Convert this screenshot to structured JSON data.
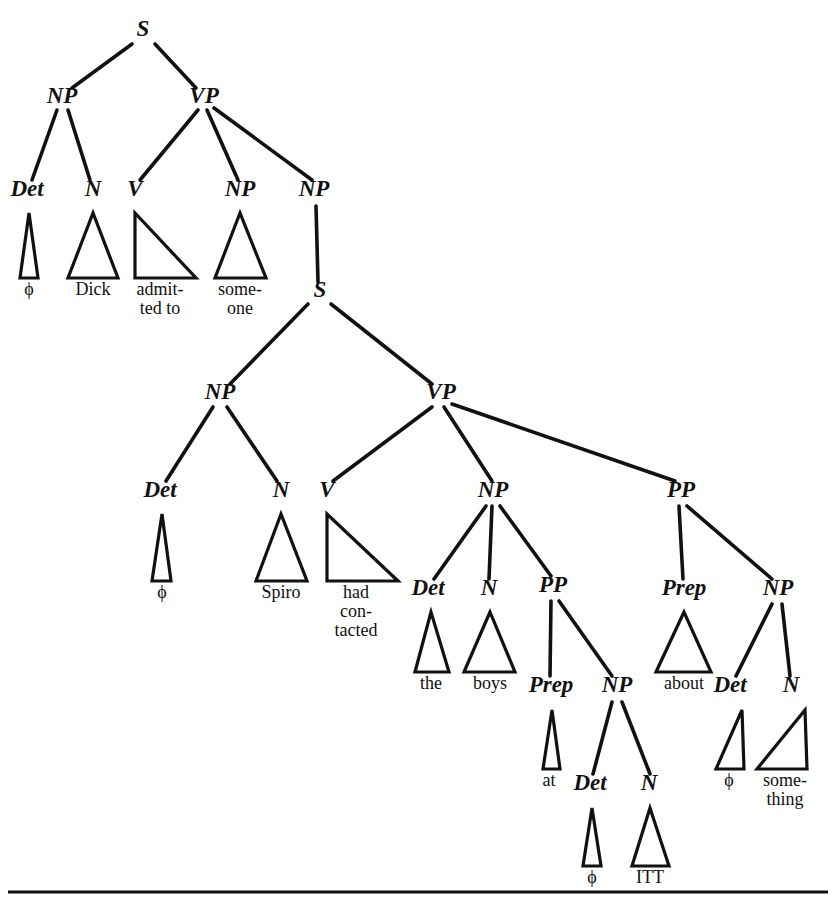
{
  "figure": {
    "type": "syntax-tree",
    "sentence": "ϕ Dick admitted to someone ϕ Spiro had contacted the boys at ϕ ITT about ϕ something",
    "ink_color": "#111111",
    "background_color": "#ffffff"
  },
  "nodes": [
    {
      "id": "S1",
      "label": "S",
      "x": 143,
      "y": 36,
      "size": 23
    },
    {
      "id": "NP1",
      "label": "NP",
      "x": 62,
      "y": 103,
      "size": 23
    },
    {
      "id": "VP1",
      "label": "VP",
      "x": 204,
      "y": 103,
      "size": 23
    },
    {
      "id": "Det1",
      "label": "Det",
      "x": 27,
      "y": 196,
      "size": 23
    },
    {
      "id": "N1",
      "label": "N",
      "x": 93,
      "y": 196,
      "size": 23
    },
    {
      "id": "V1",
      "label": "V",
      "x": 135,
      "y": 196,
      "size": 23
    },
    {
      "id": "NPso",
      "label": "NP",
      "x": 240,
      "y": 196,
      "size": 23
    },
    {
      "id": "NP2",
      "label": "NP",
      "x": 314,
      "y": 196,
      "size": 23
    },
    {
      "id": "S2",
      "label": "S",
      "x": 320,
      "y": 297,
      "size": 23
    },
    {
      "id": "NP3",
      "label": "NP",
      "x": 220,
      "y": 399,
      "size": 23
    },
    {
      "id": "VP2",
      "label": "VP",
      "x": 441,
      "y": 399,
      "size": 23
    },
    {
      "id": "Det2",
      "label": "Det",
      "x": 160,
      "y": 497,
      "size": 23
    },
    {
      "id": "N2",
      "label": "N",
      "x": 281,
      "y": 497,
      "size": 23
    },
    {
      "id": "V2",
      "label": "V",
      "x": 327,
      "y": 497,
      "size": 23
    },
    {
      "id": "NP4",
      "label": "NP",
      "x": 493,
      "y": 497,
      "size": 23
    },
    {
      "id": "PP1",
      "label": "PP",
      "x": 681,
      "y": 497,
      "size": 23
    },
    {
      "id": "Det3",
      "label": "Det",
      "x": 428,
      "y": 595,
      "size": 23
    },
    {
      "id": "N3",
      "label": "N",
      "x": 489,
      "y": 595,
      "size": 23
    },
    {
      "id": "PP2",
      "label": "PP",
      "x": 553,
      "y": 592,
      "size": 23
    },
    {
      "id": "Prep1",
      "label": "Prep",
      "x": 684,
      "y": 595,
      "size": 23
    },
    {
      "id": "NP5",
      "label": "NP",
      "x": 778,
      "y": 595,
      "size": 23
    },
    {
      "id": "Prep2",
      "label": "Prep",
      "x": 551,
      "y": 692,
      "size": 23
    },
    {
      "id": "NP6",
      "label": "NP",
      "x": 617,
      "y": 692,
      "size": 23
    },
    {
      "id": "Det5",
      "label": "Det",
      "x": 730,
      "y": 692,
      "size": 23
    },
    {
      "id": "N5",
      "label": "N",
      "x": 791,
      "y": 692,
      "size": 23
    },
    {
      "id": "Det4",
      "label": "Det",
      "x": 590,
      "y": 790,
      "size": 23
    },
    {
      "id": "N4",
      "label": "N",
      "x": 649,
      "y": 790,
      "size": 23
    }
  ],
  "edges": [
    {
      "from": "S1",
      "to": "NP1",
      "x1": 132,
      "y1": 44,
      "x2": 72,
      "y2": 88
    },
    {
      "from": "S1",
      "to": "VP1",
      "x1": 155,
      "y1": 44,
      "x2": 196,
      "y2": 88
    },
    {
      "from": "NP1",
      "to": "Det1",
      "x1": 57,
      "y1": 110,
      "x2": 32,
      "y2": 180
    },
    {
      "from": "NP1",
      "to": "N1",
      "x1": 68,
      "y1": 110,
      "x2": 90,
      "y2": 180
    },
    {
      "from": "VP1",
      "to": "V1",
      "x1": 198,
      "y1": 110,
      "x2": 140,
      "y2": 180
    },
    {
      "from": "VP1",
      "to": "NPso",
      "x1": 207,
      "y1": 110,
      "x2": 238,
      "y2": 180
    },
    {
      "from": "VP1",
      "to": "NP2",
      "x1": 214,
      "y1": 108,
      "x2": 312,
      "y2": 180
    },
    {
      "from": "NP2",
      "to": "S2",
      "x1": 316,
      "y1": 206,
      "x2": 318,
      "y2": 282
    },
    {
      "from": "S2",
      "to": "NP3",
      "x1": 308,
      "y1": 304,
      "x2": 230,
      "y2": 384
    },
    {
      "from": "S2",
      "to": "VP2",
      "x1": 331,
      "y1": 304,
      "x2": 432,
      "y2": 384
    },
    {
      "from": "NP3",
      "to": "Det2",
      "x1": 213,
      "y1": 407,
      "x2": 166,
      "y2": 481
    },
    {
      "from": "NP3",
      "to": "N3x",
      "x1": 227,
      "y1": 407,
      "x2": 277,
      "y2": 481
    },
    {
      "from": "VP2",
      "to": "V2",
      "x1": 432,
      "y1": 407,
      "x2": 333,
      "y2": 481
    },
    {
      "from": "VP2",
      "to": "NP4",
      "x1": 444,
      "y1": 407,
      "x2": 492,
      "y2": 481
    },
    {
      "from": "VP2",
      "to": "PP1",
      "x1": 452,
      "y1": 404,
      "x2": 675,
      "y2": 481
    },
    {
      "from": "NP4",
      "to": "Det3",
      "x1": 486,
      "y1": 506,
      "x2": 434,
      "y2": 579
    },
    {
      "from": "NP4",
      "to": "N3",
      "x1": 492,
      "y1": 506,
      "x2": 489,
      "y2": 579
    },
    {
      "from": "NP4",
      "to": "PP2",
      "x1": 500,
      "y1": 506,
      "x2": 551,
      "y2": 576
    },
    {
      "from": "PP1",
      "to": "Prep1",
      "x1": 679,
      "y1": 506,
      "x2": 683,
      "y2": 579
    },
    {
      "from": "PP1",
      "to": "NP5",
      "x1": 687,
      "y1": 506,
      "x2": 772,
      "y2": 579
    },
    {
      "from": "PP2",
      "to": "Prep2",
      "x1": 551,
      "y1": 601,
      "x2": 550,
      "y2": 676
    },
    {
      "from": "PP2",
      "to": "NP6",
      "x1": 559,
      "y1": 601,
      "x2": 612,
      "y2": 676
    },
    {
      "from": "NP6",
      "to": "Det4",
      "x1": 612,
      "y1": 702,
      "x2": 593,
      "y2": 774
    },
    {
      "from": "NP6",
      "to": "N4",
      "x1": 622,
      "y1": 702,
      "x2": 650,
      "y2": 774
    },
    {
      "from": "NP5",
      "to": "Det5",
      "x1": 772,
      "y1": 604,
      "x2": 736,
      "y2": 676
    },
    {
      "from": "NP5",
      "to": "N5",
      "x1": 782,
      "y1": 604,
      "x2": 790,
      "y2": 676
    }
  ],
  "triangles": [
    {
      "id": "tri-phi-1",
      "word": "ϕ",
      "shape": "narrow",
      "apex_x": 29,
      "apex_y": 213,
      "left_x": 20,
      "right_x": 38,
      "base_y": 278,
      "word_x": 29,
      "word_y": 295
    },
    {
      "id": "tri-dick",
      "word": "Dick",
      "shape": "isoceles",
      "apex_x": 93,
      "apex_y": 213,
      "left_x": 68,
      "right_x": 118,
      "base_y": 278,
      "word_x": 93,
      "word_y": 295
    },
    {
      "id": "tri-admitted-to",
      "word": "admit-\nted to",
      "shape": "right-left",
      "apex_x": 135,
      "apex_y": 213,
      "left_x": 135,
      "right_x": 196,
      "base_y": 278,
      "word_x": 160,
      "word_y": 295
    },
    {
      "id": "tri-someone",
      "word": "some-\none",
      "shape": "isoceles",
      "apex_x": 240,
      "apex_y": 213,
      "left_x": 215,
      "right_x": 266,
      "base_y": 278,
      "word_x": 240,
      "word_y": 295
    },
    {
      "id": "tri-phi-2",
      "word": "ϕ",
      "shape": "narrow",
      "apex_x": 162,
      "apex_y": 514,
      "left_x": 152,
      "right_x": 171,
      "base_y": 581,
      "word_x": 162,
      "word_y": 598
    },
    {
      "id": "tri-spiro",
      "word": "Spiro",
      "shape": "isoceles",
      "apex_x": 281,
      "apex_y": 514,
      "left_x": 256,
      "right_x": 307,
      "base_y": 581,
      "word_x": 281,
      "word_y": 598
    },
    {
      "id": "tri-had-contacted",
      "word": "had\ncon-\ntacted",
      "shape": "right-left",
      "apex_x": 327,
      "apex_y": 514,
      "left_x": 327,
      "right_x": 398,
      "base_y": 581,
      "word_x": 356,
      "word_y": 598
    },
    {
      "id": "tri-the",
      "word": "the",
      "shape": "narrow-iso",
      "apex_x": 431,
      "apex_y": 612,
      "left_x": 415,
      "right_x": 449,
      "base_y": 672,
      "word_x": 431,
      "word_y": 689
    },
    {
      "id": "tri-boys",
      "word": "boys",
      "shape": "isoceles",
      "apex_x": 490,
      "apex_y": 612,
      "left_x": 464,
      "right_x": 515,
      "base_y": 672,
      "word_x": 490,
      "word_y": 689
    },
    {
      "id": "tri-at",
      "word": "at",
      "shape": "narrow",
      "apex_x": 552,
      "apex_y": 710,
      "left_x": 543,
      "right_x": 560,
      "base_y": 769,
      "word_x": 549,
      "word_y": 786
    },
    {
      "id": "tri-about",
      "word": "about",
      "shape": "isoceles",
      "apex_x": 684,
      "apex_y": 612,
      "left_x": 656,
      "right_x": 711,
      "base_y": 672,
      "word_x": 684,
      "word_y": 689
    },
    {
      "id": "tri-phi-3",
      "word": "ϕ",
      "shape": "right-right",
      "apex_x": 742,
      "apex_y": 710,
      "left_x": 716,
      "right_x": 744,
      "base_y": 769,
      "word_x": 729,
      "word_y": 786
    },
    {
      "id": "tri-something",
      "word": "some-\nthing",
      "shape": "right-right",
      "apex_x": 805,
      "apex_y": 710,
      "left_x": 757,
      "right_x": 807,
      "base_y": 769,
      "word_x": 785,
      "word_y": 786
    },
    {
      "id": "tri-phi-4",
      "word": "ϕ",
      "shape": "narrow",
      "apex_x": 592,
      "apex_y": 808,
      "left_x": 583,
      "right_x": 601,
      "base_y": 866,
      "word_x": 592,
      "word_y": 883
    },
    {
      "id": "tri-itt",
      "word": "ITT",
      "shape": "isoceles",
      "apex_x": 650,
      "apex_y": 808,
      "left_x": 632,
      "right_x": 669,
      "base_y": 866,
      "word_x": 650,
      "word_y": 883
    }
  ],
  "multiline_leaves": {
    "admitted_to": [
      "admit-",
      "ted to"
    ],
    "someone": [
      "some-",
      "one"
    ],
    "had_contacted": [
      "had",
      "con-",
      "tacted"
    ],
    "something": [
      "some-",
      "thing"
    ]
  },
  "terminal_words": [
    "ϕ",
    "Dick",
    "admitted to",
    "someone",
    "ϕ",
    "Spiro",
    "had contacted",
    "the",
    "boys",
    "at",
    "ϕ",
    "ITT",
    "about",
    "ϕ",
    "something"
  ],
  "category_labels": [
    "S",
    "NP",
    "VP",
    "Det",
    "N",
    "V",
    "PP",
    "Prep"
  ],
  "bottom_rule": {
    "x1": 8,
    "x2": 828,
    "y": 892
  }
}
